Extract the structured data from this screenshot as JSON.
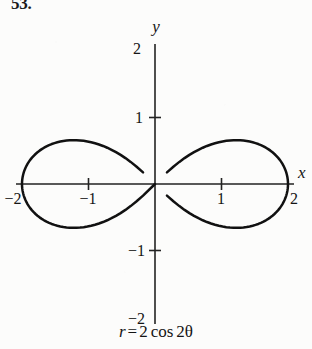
{
  "figure": {
    "problem_number": "53.",
    "caption": {
      "lhs": "r",
      "equals": "=",
      "coefficient": "2",
      "function": "cos",
      "argument": "2θ",
      "full_text": "r = 2 cos 2θ"
    },
    "axes": {
      "x_label": "x",
      "y_label": "y",
      "x_ticks": [
        {
          "value": -2,
          "label": "−2"
        },
        {
          "value": -1,
          "label": "−1"
        },
        {
          "value": 1,
          "label": "1"
        },
        {
          "value": 2,
          "label": "2"
        }
      ],
      "y_ticks": [
        {
          "value": -2,
          "label": "−2"
        },
        {
          "value": -1,
          "label": "−1"
        },
        {
          "value": 1,
          "label": "1"
        },
        {
          "value": 2,
          "label": "2"
        }
      ],
      "x_range": [
        -2.2,
        2.2
      ],
      "y_range": [
        -2.2,
        2.2
      ],
      "grid": false
    },
    "colors": {
      "curve": "#111111",
      "axis": "#222222",
      "text": "#151515",
      "background": "#fcfcfb"
    }
  },
  "chart_data": {
    "type": "line",
    "subtype": "polar-rose",
    "title": "",
    "subtitle": "",
    "equation": "r = 2 cos 2θ",
    "xlabel": "x",
    "ylabel": "y",
    "xlim": [
      -2.2,
      2.2
    ],
    "ylim": [
      -2.2,
      2.2
    ],
    "xticks": [
      -2,
      -1,
      1,
      2
    ],
    "yticks": [
      -2,
      -1,
      1,
      2
    ],
    "xticklabels": [
      "−2",
      "−1",
      "1",
      "2"
    ],
    "yticklabels": [
      "−2",
      "−1",
      "1",
      "2"
    ],
    "grid": false,
    "legend": null,
    "annotations": [
      "53."
    ],
    "polar": {
      "r_formula": "2*cos(2*theta)",
      "amplitude": 2,
      "petal_count": 4,
      "petal_tip_radius": 2,
      "petal_tip_angles_deg": [
        0,
        90,
        180,
        270
      ],
      "theta_range_deg": [
        0,
        360
      ],
      "theta_step_deg": 1
    },
    "series": [
      {
        "name": "r = 2 cos 2θ",
        "petals": [
          {
            "direction_deg": 0,
            "tip_xy": [
              2,
              0
            ]
          },
          {
            "direction_deg": 90,
            "tip_xy": [
              0,
              2
            ]
          },
          {
            "direction_deg": 180,
            "tip_xy": [
              -2,
              0
            ]
          },
          {
            "direction_deg": 270,
            "tip_xy": [
              0,
              -2
            ]
          }
        ]
      }
    ]
  }
}
